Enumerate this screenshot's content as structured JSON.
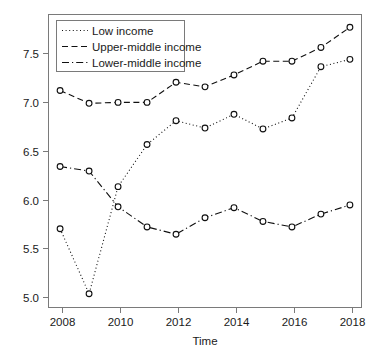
{
  "chart_data": {
    "type": "line",
    "title": "",
    "xlabel": "Time",
    "ylabel": "",
    "x": [
      2008,
      2009,
      2010,
      2011,
      2012,
      2013,
      2014,
      2015,
      2016,
      2017,
      2018
    ],
    "xtick_labels": [
      "2008",
      "2010",
      "2012",
      "2014",
      "2016",
      "2018"
    ],
    "xticks": [
      2008,
      2010,
      2012,
      2014,
      2016,
      2018
    ],
    "ytick_labels": [
      "5.0",
      "5.5",
      "6.0",
      "6.5",
      "7.0",
      "7.5"
    ],
    "yticks": [
      5.0,
      5.5,
      6.0,
      6.5,
      7.0,
      7.5
    ],
    "xlim": [
      2007.6,
      2018.4
    ],
    "ylim": [
      4.72,
      7.92
    ],
    "grid": false,
    "legend_position": "top-left",
    "series": [
      {
        "name": "Low income",
        "style": "dotted",
        "marker": "circle",
        "values": [
          5.58,
          4.87,
          6.04,
          6.5,
          6.76,
          6.68,
          6.83,
          6.67,
          6.79,
          7.35,
          7.43
        ]
      },
      {
        "name": "Upper-middle income",
        "style": "dashed",
        "marker": "circle",
        "values": [
          7.09,
          6.95,
          6.96,
          6.96,
          7.18,
          7.13,
          7.26,
          7.41,
          7.41,
          7.56,
          7.78
        ]
      },
      {
        "name": "Lower-middle income",
        "style": "dash-dot",
        "marker": "circle",
        "values": [
          6.26,
          6.21,
          5.82,
          5.6,
          5.52,
          5.7,
          5.81,
          5.66,
          5.6,
          5.74,
          5.84
        ]
      }
    ]
  },
  "legend": {
    "items": [
      {
        "label": "Low income"
      },
      {
        "label": "Upper-middle income"
      },
      {
        "label": "Lower-middle income"
      }
    ]
  },
  "axis": {
    "x_title": "Time"
  }
}
